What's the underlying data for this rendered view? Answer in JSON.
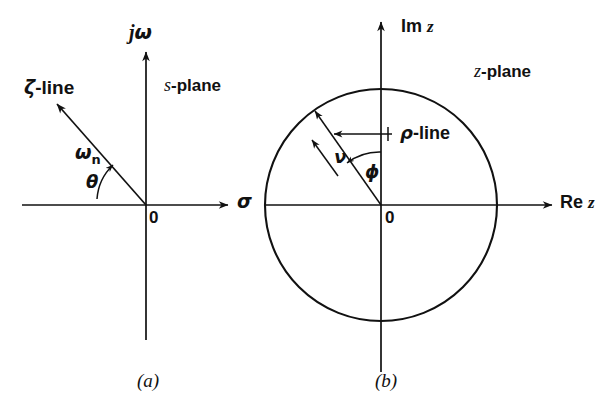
{
  "figure": {
    "background_color": "#ffffff",
    "stroke_color": "#111111",
    "width": 614,
    "height": 410
  },
  "panel_a": {
    "caption": "(a)",
    "plane_label_italic": "s",
    "plane_label_rest": "-plane",
    "vertical_axis_label_j": "j",
    "vertical_axis_label_omega": "ω",
    "horizontal_axis_label": "σ",
    "origin_label": "0",
    "zeta_line_symbol": "ζ",
    "zeta_line_rest": "-line",
    "omega_n_symbol": "ω",
    "omega_n_subscript": "n",
    "theta_symbol": "θ"
  },
  "panel_b": {
    "caption": "(b)",
    "plane_label_italic": "z",
    "plane_label_rest": "-plane",
    "vertical_axis_label_im": "Im",
    "vertical_axis_label_z": "z",
    "horizontal_axis_label_re": "Re",
    "horizontal_axis_label_z": "z",
    "origin_label": "0",
    "rho_line_symbol": "ρ",
    "rho_line_rest": "-line",
    "nu_symbol": "ν",
    "phi_symbol": "ϕ",
    "unit_circle_radius": 116
  }
}
